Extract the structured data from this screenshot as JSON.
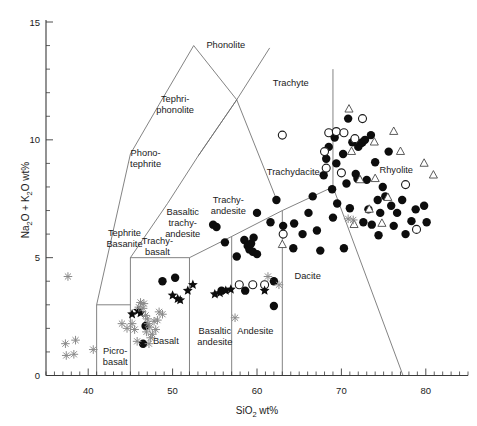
{
  "chart_data": {
    "type": "scatter",
    "title": "",
    "xlabel": "SiO2 wt%",
    "ylabel": "Na2O + K2O wt%",
    "xlim": [
      35,
      85
    ],
    "ylim": [
      0,
      15
    ],
    "grid": false,
    "legend_position": "none",
    "xticks": [
      40,
      50,
      60,
      70,
      80
    ],
    "yticks": [
      0,
      5,
      10,
      15
    ],
    "xtick_labels": [
      "40",
      "50",
      "60",
      "70",
      "80"
    ],
    "ytick_labels": [
      "0",
      "5",
      "10",
      "15"
    ],
    "x_minor_step": 1,
    "y_minor_step": 1,
    "field_labels": [
      {
        "name": "Picro-basalt",
        "lines": [
          "Picro-",
          "basalt"
        ],
        "x": 43.2,
        "y": 0.9
      },
      {
        "name": "Basalt",
        "lines": [
          "Basalt"
        ],
        "x": 49.2,
        "y": 1.35
      },
      {
        "name": "Basaltic andesite",
        "lines": [
          "Basaltic",
          "andesite"
        ],
        "x": 55.0,
        "y": 1.75
      },
      {
        "name": "Andesite",
        "lines": [
          "Andesite"
        ],
        "x": 59.8,
        "y": 1.75
      },
      {
        "name": "Dacite",
        "lines": [
          "Dacite"
        ],
        "x": 66.0,
        "y": 4.1
      },
      {
        "name": "Rhyolite",
        "lines": [
          "Rhyolite"
        ],
        "x": 76.5,
        "y": 8.6
      },
      {
        "name": "Trachyte",
        "lines": [
          "Trachyte"
        ],
        "x": 64.0,
        "y": 12.3
      },
      {
        "name": "Trachydacite",
        "lines": [
          "Trachydacite"
        ],
        "x": 64.3,
        "y": 8.5
      },
      {
        "name": "Trachyandesite",
        "lines": [
          "Trachy-",
          "andesite"
        ],
        "x": 56.6,
        "y": 7.3
      },
      {
        "name": "Basaltic trachyandesite",
        "lines": [
          "Basaltic",
          "trachy-",
          "andesite"
        ],
        "x": 51.2,
        "y": 6.8
      },
      {
        "name": "Trachybasalt",
        "lines": [
          "Trachy-",
          "basalt"
        ],
        "x": 48.2,
        "y": 5.6
      },
      {
        "name": "Tephrite Basanite",
        "lines": [
          "Tephrite",
          "Basanite"
        ],
        "x": 44.3,
        "y": 5.9
      },
      {
        "name": "Phonotephrite",
        "lines": [
          "Phono-",
          "tephrite"
        ],
        "x": 46.8,
        "y": 9.3
      },
      {
        "name": "Tephriphonolite",
        "lines": [
          "Tephri-",
          "phonolite"
        ],
        "x": 50.3,
        "y": 11.6
      },
      {
        "name": "Phonolite",
        "lines": [
          "Phonolite"
        ],
        "x": 56.3,
        "y": 13.9
      }
    ],
    "field_boundaries": [
      {
        "name": "basalt-basaltic-andesite",
        "points": [
          [
            52,
            0
          ],
          [
            52,
            5
          ]
        ]
      },
      {
        "name": "basaltic-andesite-andesite",
        "points": [
          [
            57,
            0
          ],
          [
            57,
            5.9
          ]
        ]
      },
      {
        "name": "andesite-dacite",
        "points": [
          [
            63,
            0
          ],
          [
            63,
            7
          ]
        ]
      },
      {
        "name": "picrobasalt-basalt",
        "points": [
          [
            45,
            0
          ],
          [
            45,
            5
          ]
        ]
      },
      {
        "name": "alkaline-lower-left",
        "points": [
          [
            41,
            0
          ],
          [
            41,
            3
          ]
        ]
      },
      {
        "name": "alkaline-3pct-horizontal",
        "points": [
          [
            41,
            3
          ],
          [
            45,
            3
          ]
        ]
      },
      {
        "name": "basalt-trachybasalt-top",
        "points": [
          [
            45,
            5
          ],
          [
            52,
            5
          ]
        ]
      },
      {
        "name": "trachybasalt-bta-top",
        "points": [
          [
            52,
            5
          ],
          [
            57,
            5.9
          ]
        ]
      },
      {
        "name": "bta-trachyandesite-top",
        "points": [
          [
            57,
            5.9
          ],
          [
            63,
            7
          ]
        ]
      },
      {
        "name": "trachyandesite-trachydacite",
        "points": [
          [
            63,
            7
          ],
          [
            69,
            8
          ]
        ]
      },
      {
        "name": "trachydacite-rhyolite",
        "points": [
          [
            69,
            8
          ],
          [
            69,
            13
          ]
        ]
      },
      {
        "name": "dacite-rhyolite",
        "points": [
          [
            69,
            8
          ],
          [
            77.3,
            0
          ]
        ]
      },
      {
        "name": "tephrite-phonotephrite-left",
        "points": [
          [
            41,
            3
          ],
          [
            45,
            9.4
          ]
        ]
      },
      {
        "name": "phonotephrite-tephriphonolite-left",
        "points": [
          [
            45,
            9.4
          ],
          [
            48.4,
            11.5
          ]
        ]
      },
      {
        "name": "tephriphonolite-phonolite-left",
        "points": [
          [
            48.4,
            11.5
          ],
          [
            52.5,
            14
          ]
        ]
      },
      {
        "name": "phonolite-trachyte-right",
        "points": [
          [
            52.5,
            14
          ],
          [
            57.6,
            11.7
          ]
        ]
      },
      {
        "name": "tephriphonolite-right",
        "points": [
          [
            57.6,
            11.7
          ],
          [
            53,
            9.3
          ]
        ]
      },
      {
        "name": "phonotephrite-right",
        "points": [
          [
            53,
            9.3
          ],
          [
            49.4,
            7.3
          ]
        ]
      },
      {
        "name": "bta-tephrite-right",
        "points": [
          [
            49.4,
            7.3
          ],
          [
            45,
            5
          ]
        ]
      },
      {
        "name": "trachyte-upper-right",
        "points": [
          [
            57.6,
            11.7
          ],
          [
            61.5,
            13.9
          ]
        ]
      },
      {
        "name": "trachyandesite-trachyte-right",
        "points": [
          [
            53,
            9.3
          ],
          [
            57.6,
            11.7
          ]
        ]
      },
      {
        "name": "trachyandesite-boundary-lower",
        "points": [
          [
            57.6,
            11.7
          ],
          [
            62.5,
            7.3
          ]
        ]
      }
    ],
    "series": [
      {
        "name": "filled-circles",
        "marker": "filled-circle",
        "color": "#0d0d0d",
        "points": [
          [
            48.8,
            4.0
          ],
          [
            50.3,
            4.15
          ],
          [
            54.8,
            6.4
          ],
          [
            55.2,
            6.3
          ],
          [
            56.2,
            5.65
          ],
          [
            57.6,
            5.05
          ],
          [
            58.5,
            5.75
          ],
          [
            58.9,
            5.5
          ],
          [
            59.1,
            5.35
          ],
          [
            59.3,
            5.6
          ],
          [
            59.5,
            5.25
          ],
          [
            59.6,
            5.85
          ],
          [
            60.0,
            5.15
          ],
          [
            58.6,
            3.6
          ],
          [
            55.8,
            3.6
          ],
          [
            46.8,
            2.1
          ],
          [
            46.5,
            1.35
          ],
          [
            60.0,
            6.9
          ],
          [
            61.6,
            6.5
          ],
          [
            62.3,
            7.45
          ],
          [
            63.1,
            6.35
          ],
          [
            64.4,
            6.45
          ],
          [
            62.0,
            4.0
          ],
          [
            62.0,
            2.95
          ],
          [
            64.3,
            5.4
          ],
          [
            65.4,
            6.0
          ],
          [
            66.1,
            6.9
          ],
          [
            66.6,
            7.6
          ],
          [
            67.1,
            6.15
          ],
          [
            67.5,
            5.3
          ],
          [
            67.9,
            8.5
          ],
          [
            68.2,
            9.2
          ],
          [
            68.5,
            9.7
          ],
          [
            68.9,
            7.9
          ],
          [
            69.2,
            10.1
          ],
          [
            69.4,
            9.0
          ],
          [
            69.0,
            6.7
          ],
          [
            69.5,
            7.3
          ],
          [
            70.2,
            9.4
          ],
          [
            70.6,
            8.15
          ],
          [
            70.8,
            10.9
          ],
          [
            71.0,
            7.1
          ],
          [
            71.3,
            9.9
          ],
          [
            71.7,
            8.55
          ],
          [
            71.9,
            8.35
          ],
          [
            72.0,
            9.7
          ],
          [
            72.3,
            9.85
          ],
          [
            72.5,
            9.9
          ],
          [
            72.8,
            10.0
          ],
          [
            72.6,
            6.5
          ],
          [
            73.0,
            8.3
          ],
          [
            73.2,
            7.05
          ],
          [
            73.5,
            10.2
          ],
          [
            73.6,
            6.4
          ],
          [
            74.0,
            9.05
          ],
          [
            74.3,
            7.45
          ],
          [
            74.6,
            6.9
          ],
          [
            74.9,
            8.0
          ],
          [
            75.2,
            7.6
          ],
          [
            75.6,
            9.5
          ],
          [
            75.9,
            7.2
          ],
          [
            76.2,
            6.35
          ],
          [
            76.6,
            6.9
          ],
          [
            77.2,
            7.45
          ],
          [
            77.6,
            6.0
          ],
          [
            78.3,
            6.55
          ],
          [
            78.8,
            7.05
          ],
          [
            79.8,
            7.2
          ],
          [
            80.1,
            6.5
          ],
          [
            74.4,
            5.95
          ],
          [
            70.3,
            5.4
          ]
        ]
      },
      {
        "name": "open-circles",
        "marker": "open-circle",
        "color": "#ffffff",
        "points": [
          [
            57.9,
            3.85
          ],
          [
            59.5,
            3.85
          ],
          [
            60.9,
            3.85
          ],
          [
            63.0,
            10.2
          ],
          [
            63.1,
            6.0
          ],
          [
            68.0,
            9.5
          ],
          [
            68.5,
            10.3
          ],
          [
            68.2,
            8.8
          ],
          [
            69.4,
            10.35
          ],
          [
            70.3,
            10.3
          ],
          [
            70.0,
            8.6
          ],
          [
            71.6,
            10.05
          ],
          [
            72.5,
            10.9
          ],
          [
            77.6,
            8.1
          ],
          [
            78.9,
            6.2
          ]
        ]
      },
      {
        "name": "open-triangles",
        "marker": "open-triangle",
        "color": "#ffffff",
        "points": [
          [
            63.0,
            5.55
          ],
          [
            70.9,
            11.3
          ],
          [
            71.2,
            9.5
          ],
          [
            72.2,
            8.3
          ],
          [
            73.3,
            7.05
          ],
          [
            73.9,
            9.9
          ],
          [
            74.0,
            8.35
          ],
          [
            74.8,
            6.45
          ],
          [
            75.5,
            7.55
          ],
          [
            76.2,
            10.35
          ],
          [
            77.0,
            9.5
          ],
          [
            79.8,
            9.0
          ],
          [
            80.9,
            8.5
          ],
          [
            71.5,
            6.4
          ]
        ]
      },
      {
        "name": "filled-stars",
        "marker": "filled-star",
        "color": "#0d0d0d",
        "points": [
          [
            45.2,
            2.6
          ],
          [
            45.9,
            2.75
          ],
          [
            46.2,
            2.65
          ],
          [
            50.0,
            3.4
          ],
          [
            50.6,
            3.25
          ],
          [
            50.9,
            3.2
          ],
          [
            51.8,
            3.6
          ],
          [
            52.4,
            3.85
          ],
          [
            55.0,
            3.45
          ],
          [
            55.6,
            3.5
          ],
          [
            56.3,
            3.6
          ],
          [
            56.9,
            3.65
          ],
          [
            60.9,
            3.6
          ]
        ]
      },
      {
        "name": "grey-asterisks",
        "marker": "asterisk",
        "color": "#8a8a8a",
        "points": [
          [
            37.6,
            4.2
          ],
          [
            37.3,
            1.35
          ],
          [
            38.5,
            1.5
          ],
          [
            37.4,
            0.85
          ],
          [
            38.3,
            0.9
          ],
          [
            40.6,
            1.1
          ],
          [
            44.0,
            2.2
          ],
          [
            44.6,
            2.0
          ],
          [
            45.2,
            2.2
          ],
          [
            45.5,
            1.95
          ],
          [
            46.0,
            2.9
          ],
          [
            46.2,
            3.1
          ],
          [
            46.5,
            2.85
          ],
          [
            46.6,
            3.05
          ],
          [
            46.8,
            2.55
          ],
          [
            47.0,
            2.4
          ],
          [
            47.1,
            2.2
          ],
          [
            46.9,
            1.85
          ],
          [
            47.3,
            2.05
          ],
          [
            47.4,
            1.6
          ],
          [
            47.6,
            1.75
          ],
          [
            47.8,
            2.3
          ],
          [
            48.0,
            1.95
          ],
          [
            48.2,
            2.35
          ],
          [
            48.4,
            2.7
          ],
          [
            47.2,
            1.35
          ],
          [
            45.8,
            1.45
          ],
          [
            48.8,
            2.6
          ],
          [
            61.3,
            4.2
          ],
          [
            62.6,
            3.85
          ],
          [
            57.4,
            2.45
          ],
          [
            70.8,
            6.65
          ],
          [
            71.4,
            6.6
          ]
        ]
      }
    ]
  },
  "axes": {
    "x_title": "SiO",
    "x_title_sub": "2",
    "x_title_unit": " wt%",
    "y_title_a": "Na",
    "y_title_a_sub": "2",
    "y_title_b": "O + K",
    "y_title_b_sub": "2",
    "y_title_c": "O wt%"
  }
}
